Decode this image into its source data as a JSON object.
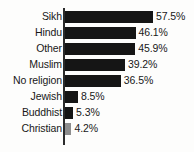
{
  "chart_data": {
    "type": "bar",
    "orientation": "horizontal",
    "title": "",
    "xlabel": "",
    "ylabel": "",
    "grid": false,
    "legend": false,
    "xlim": [
      0,
      57.5
    ],
    "value_suffix": "%",
    "categories": [
      "Sikh",
      "Hindu",
      "Other",
      "Muslim",
      "No religion",
      "Jewish",
      "Buddhist",
      "Christian"
    ],
    "values": [
      57.5,
      46.1,
      45.9,
      39.2,
      36.5,
      8.5,
      5.3,
      4.2
    ],
    "value_labels": [
      "57.5%",
      "46.1%",
      "45.9%",
      "39.2%",
      "36.5%",
      "8.5%",
      "5.3%",
      "4.2%"
    ],
    "bar_colors": [
      "#151515",
      "#151515",
      "#151515",
      "#151515",
      "#151515",
      "#151515",
      "#151515",
      "#8d8d8d"
    ]
  },
  "colors": {
    "background": "#fdfdfc",
    "bar": "#151515",
    "bar_muted": "#8d8d8d",
    "axis": "#2b2b2b",
    "text": "#181818"
  }
}
